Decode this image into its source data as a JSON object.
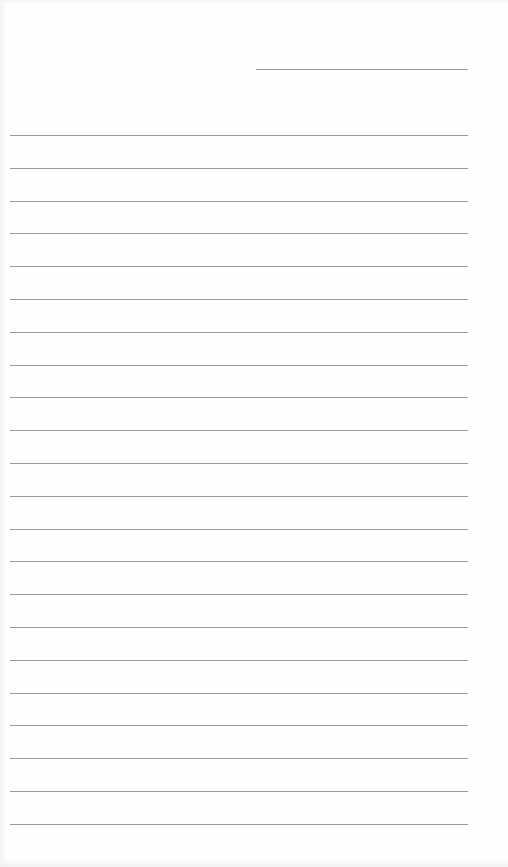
{
  "document": {
    "type": "blank lined page",
    "header_ghost_text": "",
    "header_rule": {
      "x": 256,
      "y": 69,
      "width": 212
    },
    "lines": {
      "count": 22,
      "start_y": 135,
      "spacing": 32.8,
      "x": 10,
      "width": 458,
      "color": "#9a9a9a"
    },
    "background_color": "#ffffff"
  }
}
